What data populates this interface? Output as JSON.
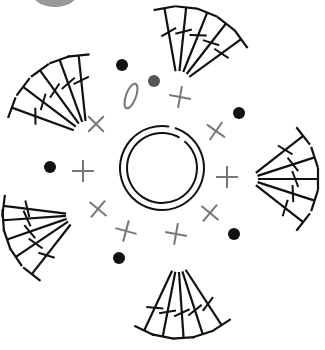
{
  "center": {
    "x": 162,
    "y": 168
  },
  "colors": {
    "stitch": "#111111",
    "gray": "#777777",
    "gray_dot": "#555555",
    "top_blob": "#999999"
  },
  "magic_ring": {
    "outer_r": 42,
    "inner_r": 35
  },
  "single_crochets": [
    {
      "x": 96,
      "y": 124,
      "rot": 45
    },
    {
      "x": 180,
      "y": 97,
      "rot": 10
    },
    {
      "x": 216,
      "y": 131,
      "rot": 35
    },
    {
      "x": 83,
      "y": 171,
      "rot": 0
    },
    {
      "x": 227,
      "y": 177,
      "rot": 0
    },
    {
      "x": 98,
      "y": 209,
      "rot": 40
    },
    {
      "x": 126,
      "y": 231,
      "rot": 15
    },
    {
      "x": 176,
      "y": 234,
      "rot": 10
    },
    {
      "x": 210,
      "y": 213,
      "rot": 40
    }
  ],
  "chain_dots": [
    {
      "x": 122,
      "y": 65,
      "fill": "#111111"
    },
    {
      "x": 239,
      "y": 113,
      "fill": "#111111"
    },
    {
      "x": 50,
      "y": 167,
      "fill": "#111111"
    },
    {
      "x": 234,
      "y": 234,
      "fill": "#111111"
    },
    {
      "x": 119,
      "y": 258,
      "fill": "#111111"
    },
    {
      "x": 154,
      "y": 81,
      "fill": "#555555"
    }
  ],
  "slip_oval": {
    "x": 131,
    "y": 96,
    "rx": 5,
    "ry": 13,
    "rot": 20
  },
  "shell_fans": [
    {
      "name": "upper-left",
      "cx": 87,
      "cy": 135,
      "angles": [
        -160,
        -143,
        -126,
        -110,
        -96
      ],
      "inner": 14,
      "outer": 80
    },
    {
      "name": "top",
      "cx": 178,
      "cy": 85,
      "angles": [
        -100,
        -84,
        -68,
        -52,
        -36
      ],
      "inner": 14,
      "outer": 78
    },
    {
      "name": "right",
      "cx": 248,
      "cy": 179,
      "angles": [
        -38,
        -18,
        0,
        18,
        38
      ],
      "inner": 10,
      "outer": 70
    },
    {
      "name": "bottom",
      "cx": 178,
      "cy": 258,
      "angles": [
        115,
        101,
        86,
        72,
        57
      ],
      "inner": 14,
      "outer": 80
    },
    {
      "name": "lower-left",
      "cx": 78,
      "cy": 215,
      "angles": [
        -173,
        -184,
        -199,
        -214,
        -232
      ],
      "inner": 12,
      "outer": 75
    }
  ]
}
